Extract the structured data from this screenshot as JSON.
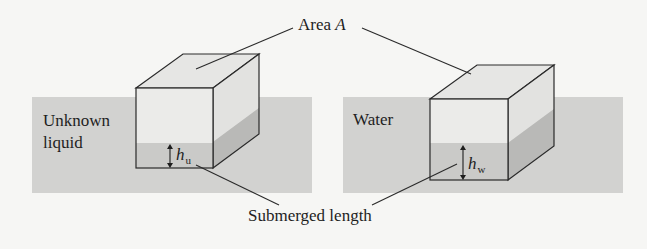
{
  "figure": {
    "top_label": {
      "text": "Area ",
      "var": "A"
    },
    "bottom_label": "Submerged length",
    "left_panel": {
      "liquid_label_line1": "Unknown",
      "liquid_label_line2": "liquid",
      "height_symbol": "h",
      "height_subscript": "u"
    },
    "right_panel": {
      "liquid_label": "Water",
      "height_symbol": "h",
      "height_subscript": "w"
    }
  },
  "colors": {
    "background": "#f6f6f4",
    "liquid": "#d2d2d0",
    "cube_front": "#ebebe9",
    "cube_top": "#e6e6e4",
    "cube_side": "#dcdcda",
    "cube_front_submerged": "#cacac8",
    "cube_side_submerged": "#b9b9b7",
    "line": "#2a2a2a"
  }
}
